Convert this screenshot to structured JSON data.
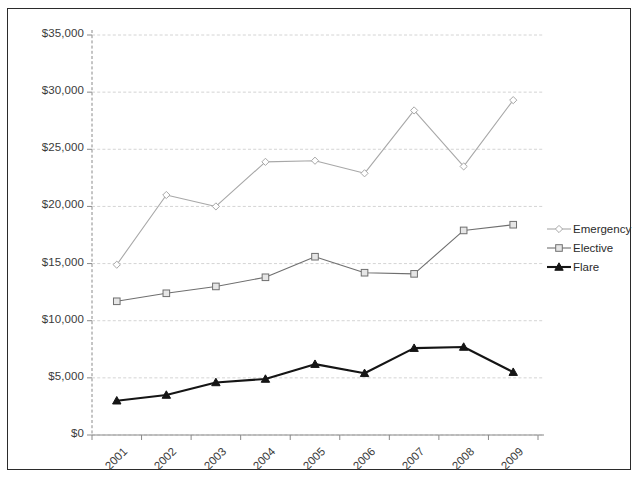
{
  "chart_data": {
    "type": "line",
    "title": "",
    "subtitle": "",
    "xlabel": "",
    "ylabel": "",
    "categories": [
      "2001",
      "2002",
      "2003",
      "2004",
      "2005",
      "2006",
      "2007",
      "2008",
      "2009"
    ],
    "ylim": [
      0,
      35000
    ],
    "ytick_values": [
      0,
      5000,
      10000,
      15000,
      20000,
      25000,
      30000,
      35000
    ],
    "ytick_labels": [
      "$0",
      "$5,000",
      "$10,000",
      "$15,000",
      "$20,000",
      "$25,000",
      "$30,000",
      "$35,000"
    ],
    "grid": true,
    "grid_axis": "y",
    "legend_position": "right",
    "series": [
      {
        "name": "Emergency",
        "color": "#a8a8a8",
        "marker": "diamond",
        "values": [
          14900,
          21000,
          20000,
          23900,
          24000,
          22900,
          28400,
          23500,
          29300
        ]
      },
      {
        "name": "Elective",
        "color": "#6f6f6f",
        "marker": "square",
        "values": [
          11700,
          12400,
          13000,
          13800,
          15600,
          14200,
          14100,
          17900,
          18400
        ]
      },
      {
        "name": "Flare",
        "color": "#151515",
        "marker": "triangle",
        "values": [
          3000,
          3500,
          4600,
          4900,
          6200,
          5400,
          7600,
          7700,
          5500
        ]
      }
    ]
  },
  "axes": {
    "y_tick_labels": [
      "$35,000",
      "$30,000",
      "$25,000",
      "$20,000",
      "$15,000",
      "$10,000",
      "$5,000",
      "$0"
    ],
    "x_tick_labels": [
      "2001",
      "2002",
      "2003",
      "2004",
      "2005",
      "2006",
      "2007",
      "2008",
      "2009"
    ]
  },
  "legend": {
    "items": [
      {
        "label": "Emergency",
        "color": "#a8a8a8",
        "marker": "diamond"
      },
      {
        "label": "Elective",
        "color": "#6f6f6f",
        "marker": "square"
      },
      {
        "label": "Flare",
        "color": "#151515",
        "marker": "triangle"
      }
    ]
  },
  "colors": {
    "emergency": "#a8a8a8",
    "elective": "#6f6f6f",
    "flare": "#151515",
    "grid": "#cfcfcf",
    "axis": "#8a8a8a",
    "border": "#2b2b2b",
    "text": "#3a3a3a",
    "background": "#ffffff"
  }
}
